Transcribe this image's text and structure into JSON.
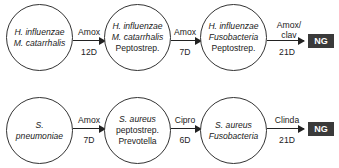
{
  "rows": [
    {
      "nodes": [
        {
          "lines": [
            "H. influenzae",
            "M. catarrhalis"
          ],
          "italic": [
            true,
            true
          ]
        },
        {
          "lines": [
            "H. influenzae",
            "M. catarrhalis",
            "Peptostrep."
          ],
          "italic": [
            true,
            true,
            false
          ]
        },
        {
          "lines": [
            "H. influenzae",
            "Fusobacteria",
            "Peptostrep."
          ],
          "italic": [
            true,
            true,
            false
          ]
        }
      ],
      "arrows": [
        {
          "drug": "Amox",
          "duration": "12D"
        },
        {
          "drug": "Amox",
          "duration": "7D"
        },
        {
          "drug": "Amox/ clav",
          "duration": "21D"
        }
      ],
      "end": "NG"
    },
    {
      "nodes": [
        {
          "lines": [
            "S.",
            "pneumoniae"
          ],
          "italic": [
            true,
            true
          ]
        },
        {
          "lines": [
            "S. aureus",
            "peptostrep.",
            "Prevotella"
          ],
          "italic": [
            true,
            false,
            false
          ]
        },
        {
          "lines": [
            "S. aureus",
            "Fusobacteria"
          ],
          "italic": [
            true,
            true
          ]
        }
      ],
      "arrows": [
        {
          "drug": "Amox",
          "duration": "7D"
        },
        {
          "drug": "Cipro",
          "duration": "6D"
        },
        {
          "drug": "Clinda",
          "duration": "21D"
        }
      ],
      "end": "NG"
    }
  ]
}
